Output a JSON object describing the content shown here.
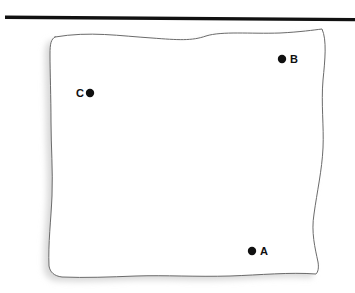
{
  "figure": {
    "type": "diagram",
    "background_color": "#ffffff",
    "width": 355,
    "height": 293
  },
  "top_bar": {
    "name": "horizontal-rule",
    "color": "#111111",
    "x1": 5,
    "y1": 17.2,
    "x2": 355,
    "y2": 19.6,
    "thickness": 3.4
  },
  "sheet": {
    "name": "wavy-sheet",
    "fill_color": "#ffffff",
    "stroke_color": "#6b6b6b",
    "stroke_width": 1,
    "shadow_color": "#d8d8d8",
    "shadow_offset_x": -5,
    "shadow_offset_y": 4,
    "outline_path": "M 55 37 C 90 31, 120 36, 152 38 C 178 40, 192 41, 206 36 C 222 31, 250 34, 280 33 C 300 32, 314 30, 322 29 C 327 40, 325 60, 323 80 C 321 104, 324 126, 323 148 C 322 170, 317 192, 314 214 C 311 232, 315 248, 318 262 C 319 268, 318 272, 316 274 C 290 272, 260 275, 230 276 C 196 277, 165 275, 136 276 C 110 277, 85 278, 62 277 C 54 276, 50 272, 49 266 C 48 244, 51 220, 52 196 C 53 170, 51 146, 51 122 C 51 98, 50 72, 50 54 C 50 44, 51 39, 55 37 Z"
  },
  "points": [
    {
      "id": "A",
      "label": "A",
      "dot_x": 252,
      "dot_y": 251,
      "dot_radius": 4.2,
      "dot_color": "#101010",
      "label_x": 260,
      "label_y": 251,
      "label_side": "right"
    },
    {
      "id": "B",
      "label": "B",
      "dot_x": 282,
      "dot_y": 59,
      "dot_radius": 4.2,
      "dot_color": "#101010",
      "label_x": 290,
      "label_y": 59,
      "label_side": "right"
    },
    {
      "id": "C",
      "label": "C",
      "dot_x": 90,
      "dot_y": 93,
      "dot_radius": 4.2,
      "dot_color": "#101010",
      "label_x": 84,
      "label_y": 93,
      "label_side": "left"
    }
  ]
}
